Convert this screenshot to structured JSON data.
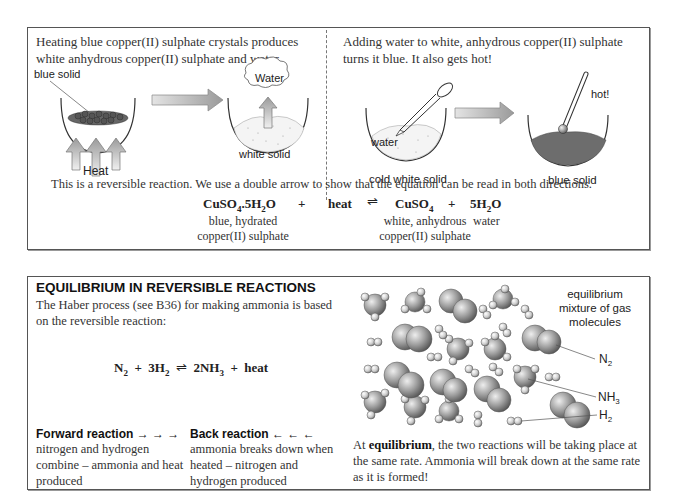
{
  "top_panel": {
    "left": {
      "intro": "Heating blue copper(II) sulphate crystals produces white anhydrous copper(II) sulphate and water.",
      "labels": {
        "blue_solid": "blue solid",
        "heat": "Heat",
        "water": "Water",
        "white_solid": "white solid"
      }
    },
    "right": {
      "intro": "Adding water to white, anhydrous copper(II) sulphate turns it blue. It also gets hot!",
      "labels": {
        "water": "water",
        "cold_white_solid": "cold white solid",
        "hot": "hot!",
        "blue_solid": "blue solid"
      }
    },
    "caption": "This is a reversible reaction.  We use a double arrow to show that the equation can be read in both directions.",
    "equation": {
      "reactant1": "CuSO",
      "reactant1_sub": "4",
      "reactant1_rest": ".5H",
      "reactant1_sub2": "2",
      "reactant1_end": "O",
      "plus1": "+",
      "reactant2": "heat",
      "arrow": "⇌",
      "product1": "CuSO",
      "product1_sub": "4",
      "plus2": "+",
      "product2": "5H",
      "product2_sub": "2",
      "product2_end": "O",
      "label_reactant1_line1": "blue, hydrated",
      "label_reactant1_line2": "copper(II) sulphate",
      "label_product1_line1": "white, anhydrous",
      "label_product1_line2": "copper(II) sulphate",
      "label_product2": "water"
    }
  },
  "bottom_panel": {
    "heading": "EQUILIBRIUM IN REVERSIBLE REACTIONS",
    "intro": "The Haber process (see B36) for making ammonia is based on the reversible reaction:",
    "equation": {
      "n": "N",
      "n_sub": "2",
      "plus1": "+",
      "h": "3H",
      "h_sub": "2",
      "arrow": "⇌",
      "nh": "2NH",
      "nh_sub": "3",
      "plus2": "+",
      "heat": "heat"
    },
    "forward": {
      "title": "Forward reaction → → →",
      "text": "nitrogen and hydrogen combine – ammonia and heat produced"
    },
    "back": {
      "title": "Back reaction ← ← ←",
      "text": "ammonia breaks down when heated – nitrogen and hydrogen produced"
    },
    "diagram": {
      "caption_line1": "equilibrium",
      "caption_line2": "mixture of gas",
      "caption_line3": "molecules",
      "n2": "N",
      "n2_sub": "2",
      "nh3": "NH",
      "nh3_sub": "3",
      "h2": "H",
      "h2_sub": "2"
    },
    "equilibrium_text_bold": "equilibrium",
    "equilibrium_text_pre": "At ",
    "equilibrium_text_post": ", the two reactions will be taking place at the same rate. Ammonia will break down at the same rate as it is formed!"
  }
}
